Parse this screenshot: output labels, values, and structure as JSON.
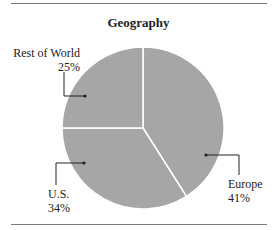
{
  "chart_data": {
    "type": "pie",
    "title": "Geography",
    "start_angle_deg": 0,
    "direction": "clockwise",
    "slices": [
      {
        "label": "Europe",
        "value": 41,
        "display": "41%",
        "color": "#a6a6a6"
      },
      {
        "label": "U.S.",
        "value": 34,
        "display": "34%",
        "color": "#a6a6a6"
      },
      {
        "label": "Rest of World",
        "value": 25,
        "display": "25%",
        "color": "#a6a6a6"
      }
    ],
    "separator_color": "#ffffff",
    "legend": "none"
  }
}
